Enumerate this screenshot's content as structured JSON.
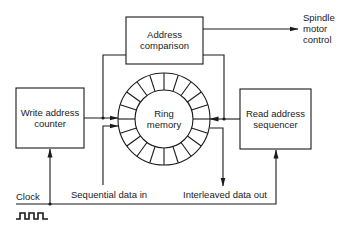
{
  "diagram": {
    "blocks": {
      "address_comparison": {
        "line1": "Address",
        "line2": "comparison"
      },
      "write_address_counter": {
        "line1": "Write address",
        "line2": "counter"
      },
      "ring_memory": {
        "line1": "Ring",
        "line2": "memory",
        "segments": 20
      },
      "read_address_sequencer": {
        "line1": "Read address",
        "line2": "sequencer"
      }
    },
    "labels": {
      "spindle_line1": "Spindle",
      "spindle_line2": "motor",
      "spindle_line3": "control",
      "clock": "Clock",
      "data_in": "Sequential data in",
      "data_out": "Interleaved data out"
    },
    "colors": {
      "stroke": "#1a1a1a",
      "background": "#ffffff"
    }
  }
}
